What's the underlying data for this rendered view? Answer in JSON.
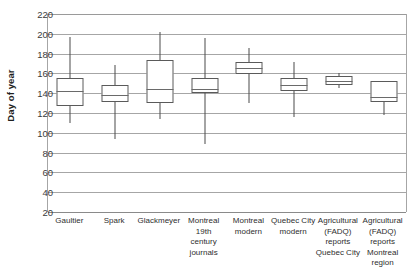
{
  "chart_data": {
    "type": "box",
    "title": "",
    "xlabel": "",
    "ylabel": "Day of year",
    "ylim": [
      20,
      220
    ],
    "ytick_step": 20,
    "grid": true,
    "legend": "none",
    "yticks": [
      "220",
      "200",
      "180",
      "160",
      "140",
      "120",
      "100",
      "80",
      "60",
      "40",
      "20"
    ],
    "categories": [
      "Gaultier",
      "Spark",
      "Glackmeyer",
      "Montreal 19th century journals",
      "Montreal modern",
      "Quebec City modern",
      "Agricultural (FADQ) reports Quebec City",
      "Agricultural (FADQ) reports Montreal region"
    ],
    "category_lines": [
      [
        "Gaultier"
      ],
      [
        "Spark"
      ],
      [
        "Glackmeyer"
      ],
      [
        "Montreal",
        "19th",
        "century",
        "journals"
      ],
      [
        "Montreal",
        "modern"
      ],
      [
        "Quebec City",
        "modern"
      ],
      [
        "Agricultural",
        "(FADQ)",
        "reports",
        "Quebec City"
      ],
      [
        "Agricultural",
        "(FADQ)",
        "reports",
        "Montreal",
        "region"
      ]
    ],
    "boxes": [
      {
        "name": "Gaultier",
        "whisker_low": 110,
        "q1": 127,
        "median": 142,
        "q3": 155,
        "whisker_high": 197
      },
      {
        "name": "Spark",
        "whisker_low": 94,
        "q1": 131,
        "median": 138,
        "q3": 148,
        "whisker_high": 168
      },
      {
        "name": "Glackmeyer",
        "whisker_low": 114,
        "q1": 130,
        "median": 144,
        "q3": 174,
        "whisker_high": 202
      },
      {
        "name": "Montreal 19th century journals",
        "whisker_low": 89,
        "q1": 140,
        "median": 144,
        "q3": 155,
        "whisker_high": 196
      },
      {
        "name": "Montreal modern",
        "whisker_low": 130,
        "q1": 159,
        "median": 165,
        "q3": 172,
        "whisker_high": 186
      },
      {
        "name": "Quebec City modern",
        "whisker_low": 116,
        "q1": 142,
        "median": 148,
        "q3": 155,
        "whisker_high": 172
      },
      {
        "name": "Agricultural (FADQ) reports Quebec City",
        "whisker_low": 145,
        "q1": 148,
        "median": 152,
        "q3": 157,
        "whisker_high": 160
      },
      {
        "name": "Agricultural (FADQ) reports Montreal region",
        "whisker_low": 118,
        "q1": 131,
        "median": 136,
        "q3": 152,
        "whisker_high": 152
      }
    ]
  },
  "colors": {
    "gridline": "#a6a6a6",
    "box_stroke": "#5a5a5a",
    "whisker": "#4a4a4a",
    "text": "#2e2e2e",
    "background": "#ffffff"
  }
}
